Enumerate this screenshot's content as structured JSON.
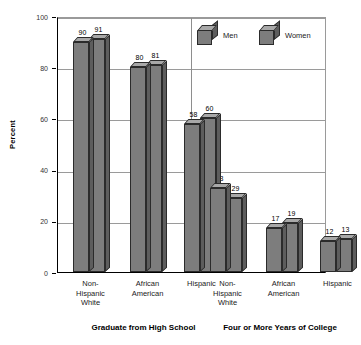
{
  "chart_data": {
    "type": "bar",
    "title": "",
    "subtitle": "",
    "xlabel": "",
    "ylabel": "Percent",
    "ylim": [
      0,
      100
    ],
    "yticks": [
      0,
      20,
      40,
      60,
      80,
      100
    ],
    "ytick_labels": [
      "0",
      "20",
      "40",
      "60",
      "80",
      "100"
    ],
    "grid": true,
    "legend_position": "top-right",
    "legend": [
      "Men",
      "Women"
    ],
    "groups": [
      {
        "title": "Graduate from High School",
        "categories": [
          "Non-\nHispanic\nWhite",
          "African\nAmerican",
          "Hispanic"
        ],
        "series": [
          {
            "name": "Men",
            "values": [
              90,
              80,
              58
            ]
          },
          {
            "name": "Women",
            "values": [
              91,
              81,
              60
            ]
          }
        ]
      },
      {
        "title": "Four or More Years of College",
        "categories": [
          "Non-\nHispanic\nWhite",
          "African\nAmerican",
          "Hispanic"
        ],
        "series": [
          {
            "name": "Men",
            "values": [
              33,
              17,
              12
            ]
          },
          {
            "name": "Women",
            "values": [
              29,
              19,
              13
            ]
          }
        ]
      }
    ]
  },
  "colors": {
    "bar_front": "#7d7d7d",
    "bar_side": "#5d5d5d",
    "bar_top": "#a8a8a8",
    "bar_edge": "#2b2b2b",
    "gridline": "#9a9a9a",
    "axis": "#000000",
    "background": "#ffffff"
  },
  "axis": {
    "y_title": "Percent"
  }
}
